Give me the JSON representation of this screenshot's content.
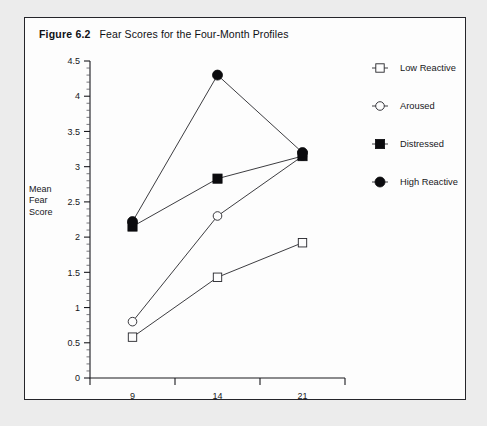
{
  "figure": {
    "label": "Figure 6.2",
    "title": "Fear Scores for the Four-Month Profiles"
  },
  "chart_data": {
    "type": "line",
    "title": "Fear Scores for the Four-Month Profiles",
    "xlabel": "Age in Months",
    "ylabel": "Mean Fear Score",
    "ylabel_lines": [
      "Mean",
      "Fear",
      "Score"
    ],
    "categories": [
      "9",
      "14",
      "21"
    ],
    "xtick_labels": [
      "9",
      "14",
      "21"
    ],
    "ytick_labels": [
      "0",
      "0.5",
      "1",
      "1.5",
      "2",
      "2.5",
      "3",
      "3.5",
      "4",
      "4.5"
    ],
    "ytick_values": [
      0,
      0.5,
      1,
      1.5,
      2,
      2.5,
      3,
      3.5,
      4,
      4.5
    ],
    "ylim": [
      0,
      4.5
    ],
    "minor_tick_step": 0.1,
    "grid": false,
    "legend_position": "right",
    "series": [
      {
        "name": "Low Reactive",
        "marker": "open-square",
        "values": [
          0.58,
          1.43,
          1.92
        ]
      },
      {
        "name": "Aroused",
        "marker": "open-circle",
        "values": [
          0.8,
          2.3,
          3.15
        ]
      },
      {
        "name": "Distressed",
        "marker": "filled-square",
        "values": [
          2.15,
          2.83,
          3.15
        ]
      },
      {
        "name": "High Reactive",
        "marker": "filled-circle",
        "values": [
          2.22,
          4.3,
          3.2
        ]
      }
    ]
  },
  "legend": {
    "items": [
      {
        "label": "Low Reactive",
        "marker": "open-square"
      },
      {
        "label": "Aroused",
        "marker": "open-circle"
      },
      {
        "label": "Distressed",
        "marker": "filled-square"
      },
      {
        "label": "High Reactive",
        "marker": "filled-circle"
      }
    ]
  },
  "colors": {
    "ink": "#1a1a1f",
    "page_background": "#ececec",
    "figure_background": "#fdfdfd"
  }
}
